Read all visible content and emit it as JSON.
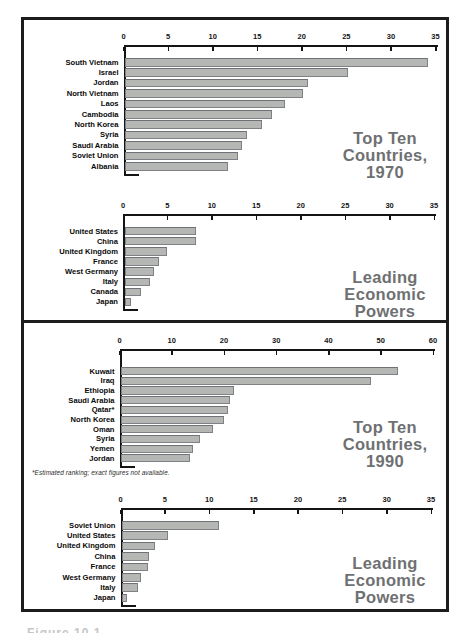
{
  "figure": {
    "footnote": "*Estimated ranking; exact figures not available.",
    "caption_partial": "Figure 10.1"
  },
  "chart_data": [
    {
      "type": "bar",
      "orientation": "horizontal",
      "title": "Top Ten Countries, 1970",
      "title_lines": [
        "Top Ten",
        "Countries,",
        "1970"
      ],
      "xlim": [
        0,
        35
      ],
      "ticks": [
        0,
        5,
        10,
        15,
        20,
        25,
        30,
        35
      ],
      "grid": false,
      "categories": [
        "South Vietnam",
        "Israel",
        "Jordan",
        "North Vietnam",
        "Laos",
        "Cambodia",
        "North Korea",
        "Syria",
        "Saudi Arabia",
        "Soviet Union",
        "Albania"
      ],
      "values": [
        34,
        25,
        20.5,
        20,
        18,
        16.5,
        15.4,
        13.7,
        13.1,
        12.7,
        11.6
      ]
    },
    {
      "type": "bar",
      "orientation": "horizontal",
      "title": "Leading Economic Powers",
      "title_lines": [
        "Leading",
        "Economic",
        "Powers"
      ],
      "xlim": [
        0,
        35
      ],
      "ticks": [
        0,
        5,
        10,
        15,
        20,
        25,
        30,
        35
      ],
      "grid": false,
      "categories": [
        "United States",
        "China",
        "United Kingdom",
        "France",
        "West Germany",
        "Italy",
        "Canada",
        "Japan"
      ],
      "values": [
        8.1,
        8,
        4.8,
        3.9,
        3.3,
        2.9,
        1.9,
        0.7
      ]
    },
    {
      "type": "bar",
      "orientation": "horizontal",
      "title": "Top Ten Countries, 1990",
      "title_lines": [
        "Top Ten",
        "Countries,",
        "1990"
      ],
      "xlim": [
        0,
        60
      ],
      "ticks": [
        0,
        10,
        20,
        30,
        40,
        50,
        60
      ],
      "grid": false,
      "categories": [
        "Kuwait",
        "Iraq",
        "Ethiopia",
        "Saudi Arabia",
        "Qatar*",
        "North Korea",
        "Oman",
        "Syria",
        "Yemen",
        "Jordan"
      ],
      "values": [
        53,
        47.8,
        21.6,
        20.9,
        20.4,
        19.7,
        17.6,
        15.2,
        13.7,
        13.3
      ]
    },
    {
      "type": "bar",
      "orientation": "horizontal",
      "title": "Leading Economic Powers",
      "title_lines": [
        "Leading",
        "Economic",
        "Powers"
      ],
      "xlim": [
        0,
        35
      ],
      "ticks": [
        0,
        5,
        10,
        15,
        20,
        25,
        30,
        35
      ],
      "grid": false,
      "categories": [
        "Soviet Union",
        "United States",
        "United Kingdom",
        "China",
        "France",
        "West Germany",
        "Italy",
        "Japan"
      ],
      "values": [
        10.9,
        5.2,
        3.7,
        3,
        2.9,
        2.1,
        1.8,
        0.6
      ]
    }
  ]
}
